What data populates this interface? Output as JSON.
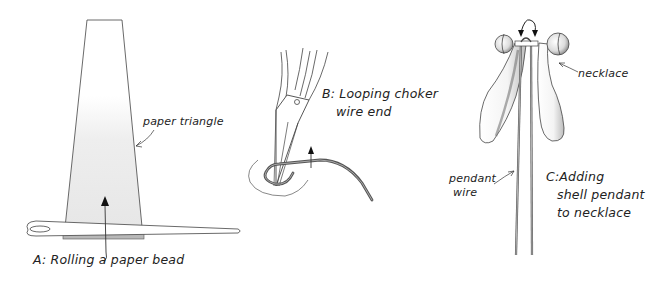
{
  "panels": {
    "a": {
      "caption": "A: Rolling a paper bead",
      "callout": "paper triangle"
    },
    "b": {
      "caption_line1": "B: Looping choker",
      "caption_line2": "wire end"
    },
    "c": {
      "caption_line1": "C:Adding",
      "caption_line2": "shell pendant",
      "caption_line3": "to necklace",
      "callout_necklace": "necklace",
      "callout_wire_line1": "pendant",
      "callout_wire_line2": "wire"
    }
  },
  "colors": {
    "ink": "#333333",
    "paper_shade": "#ececec",
    "needle_fill": "#ffffff",
    "wire": "#555555"
  }
}
